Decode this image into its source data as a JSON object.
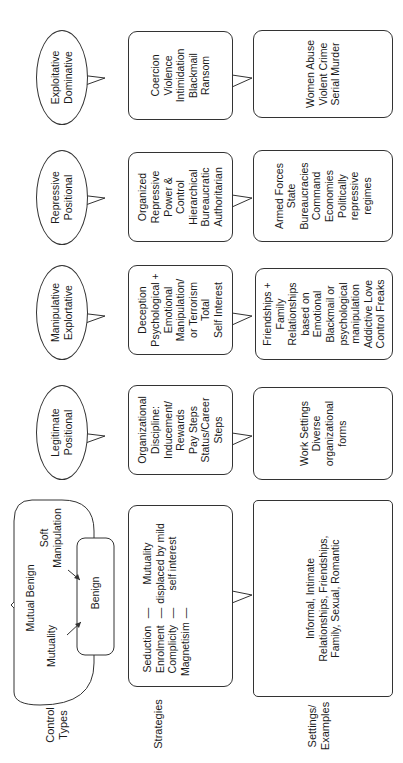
{
  "row_labels": {
    "control_types": [
      "Control",
      "Types"
    ],
    "strategies": "Strategies",
    "settings": [
      "Settings/",
      "Examples"
    ]
  },
  "control_types": {
    "mutual_benign": {
      "title": "Mutual Benign",
      "left_label": "Mutuality",
      "right_label_1": "Soft",
      "right_label_2": "Manipulation",
      "inner_label": "Benign"
    },
    "legitimate": [
      "Legitimate",
      "Positional"
    ],
    "manipulative": [
      "Manipulative",
      "Explortative"
    ],
    "repressive": [
      "Repressive",
      "Positional"
    ],
    "exploitative": [
      "Exploitative",
      "Dominative"
    ]
  },
  "strategies": {
    "mutual_benign": {
      "rows": [
        {
          "term": "Seduction",
          "dash": "—",
          "note": "Mutuality"
        },
        {
          "term": "Enrolment",
          "dash": "—",
          "note": "displaced by mild"
        },
        {
          "term": "Complicity",
          "dash": "—",
          "note": "self interest"
        },
        {
          "term": "Magnetisim",
          "dash": "—",
          "note": ""
        }
      ]
    },
    "legitimate": [
      "Organizational",
      "Discipline:",
      "Inducement/",
      "Rewards",
      "Pay Steps",
      "Status/Career",
      "Steps"
    ],
    "manipulative": [
      "Deception",
      "Psychological +",
      "Emotional",
      "Manipulation/",
      "or Terrorism",
      "Total",
      "Self Interest"
    ],
    "repressive": [
      "Organized",
      "Repressive",
      "Power &",
      "Control",
      "Hierarchical",
      "Bureaucratic",
      "Authoritarian"
    ],
    "exploitative": [
      "Coercion",
      "Violence",
      "Intimidation",
      "Blackmail",
      "Ransom"
    ]
  },
  "settings": {
    "mutual_benign": [
      "Informal, Intimate",
      "Relationships, Friendships,",
      "Family, Sexual, Romantic"
    ],
    "legitimate": [
      "Work Settings",
      "Diverse",
      "organizational",
      "forms"
    ],
    "manipulative": [
      "Friendships +",
      "Family",
      "Relationships",
      "based on",
      "Emotional",
      "Blackmail or",
      "psychological",
      "manipulation",
      "Addictive Love",
      "Control Freaks"
    ],
    "repressive": [
      "Armed Forces",
      "State",
      "Bureaucracies",
      "Command",
      "Economies",
      "Politically",
      "repressive",
      "regimes"
    ],
    "exploitative": [
      "Women Abuse",
      "Violent Crime",
      "Serial Murder"
    ]
  },
  "colors": {
    "stroke": "#333333",
    "text": "#1a1a1a",
    "background": "#ffffff"
  }
}
